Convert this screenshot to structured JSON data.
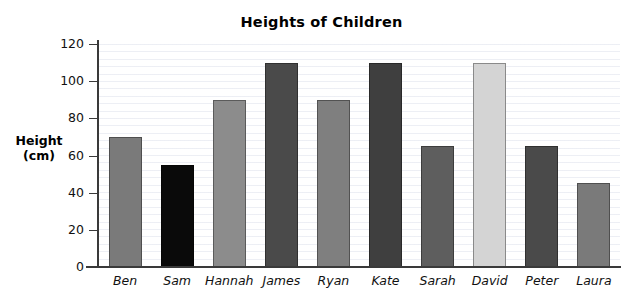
{
  "chart_data": {
    "type": "bar",
    "title": "Heights of Children",
    "xlabel": "",
    "ylabel": "Height (cm)",
    "ylabel_lines": [
      "Height",
      "(cm)"
    ],
    "categories": [
      "Ben",
      "Sam",
      "Hannah",
      "James",
      "Ryan",
      "Kate",
      "Sarah",
      "David",
      "Peter",
      "Laura"
    ],
    "values": [
      70,
      55,
      90,
      110,
      90,
      110,
      65,
      110,
      65,
      45
    ],
    "bar_colors": [
      "#7a7a7a",
      "#0a0a0a",
      "#8c8c8c",
      "#4a4a4a",
      "#7f7f7f",
      "#3f3f3f",
      "#5e5e5e",
      "#d4d4d4",
      "#4a4a4a",
      "#7a7a7a"
    ],
    "ylim": [
      0,
      120
    ],
    "ytick_values": [
      0,
      20,
      40,
      60,
      80,
      100,
      120
    ],
    "ytick_labels": [
      "0",
      "20",
      "40",
      "60",
      "80",
      "100",
      "120"
    ],
    "grid": true,
    "grid_orientation": "horizontal",
    "legend": null,
    "legend_position": "none",
    "background_color": "#ffffff",
    "axis_color": "#3a3a3a"
  }
}
